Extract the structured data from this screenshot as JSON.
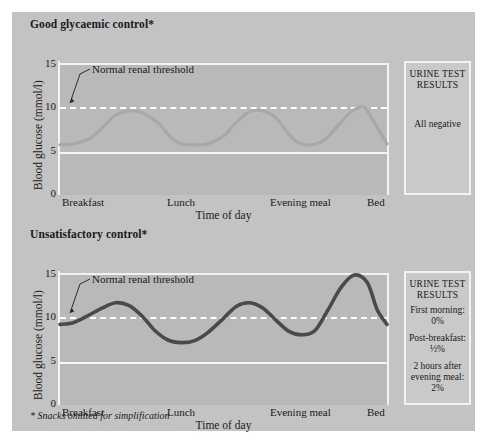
{
  "figure": {
    "background_color": "#c3c3c3",
    "plot_background_color": "#b9b9b9",
    "footnote": "* Snacks omitted for simplification"
  },
  "panels": [
    {
      "id": "good",
      "title": "Good glycaemic control*",
      "ylabel": "Blood glucose (mmol/l)",
      "xlabel": "Time of day",
      "yticks": [
        "15",
        "10",
        "5",
        "0"
      ],
      "xticks": [
        "Breakfast",
        "Lunch",
        "Evening meal",
        "Bed"
      ],
      "annotation": "Normal renal threshold",
      "urine_heading_line1": "URINE TEST",
      "urine_heading_line2": "RESULTS",
      "urine_results": [
        "All negative"
      ]
    },
    {
      "id": "bad",
      "title": "Unsatisfactory control*",
      "ylabel": "Blood glucose (mmol/l)",
      "xlabel": "Time of day",
      "yticks": [
        "15",
        "10",
        "5",
        "0"
      ],
      "xticks": [
        "Breakfast",
        "Lunch",
        "Evening meal",
        "Bed"
      ],
      "annotation": "Normal renal threshold",
      "urine_heading_line1": "URINE TEST",
      "urine_heading_line2": "RESULTS",
      "urine_results": [
        "First morning:",
        "0%",
        "Post-breakfast:",
        "½%",
        "2 hours after",
        "evening meal:",
        "2%"
      ]
    }
  ],
  "chart_data": [
    {
      "type": "line",
      "title": "Good glycaemic control*",
      "xlabel": "Time of day",
      "ylabel": "Blood glucose (mmol/l)",
      "ylim": [
        0,
        15
      ],
      "yticks": [
        0,
        5,
        10,
        15
      ],
      "x_categories": [
        "Breakfast",
        "Lunch",
        "Evening meal",
        "Bed"
      ],
      "x_category_positions": [
        0,
        0.37,
        0.73,
        1.0
      ],
      "grid": false,
      "legend": "none",
      "line_color": "#a8a8a8",
      "threshold_line": {
        "label": "Normal renal threshold",
        "value": 10.2,
        "style": "dashed",
        "color": "#ffffff"
      },
      "gridline_5": {
        "value": 5,
        "color": "#f6f6f6"
      },
      "series": [
        {
          "name": "Blood glucose",
          "x": [
            0.0,
            0.04,
            0.09,
            0.13,
            0.17,
            0.21,
            0.25,
            0.3,
            0.34,
            0.37,
            0.41,
            0.45,
            0.5,
            0.54,
            0.58,
            0.62,
            0.66,
            0.7,
            0.73,
            0.77,
            0.81,
            0.85,
            0.89,
            0.93,
            0.96,
            1.0
          ],
          "values": [
            5.8,
            5.9,
            6.5,
            7.8,
            9.2,
            9.7,
            9.5,
            8.3,
            6.6,
            5.9,
            5.8,
            5.9,
            6.8,
            8.4,
            9.6,
            9.7,
            8.9,
            7.0,
            6.0,
            5.8,
            6.4,
            8.0,
            9.6,
            10.1,
            8.4,
            5.9
          ]
        }
      ]
    },
    {
      "type": "line",
      "title": "Unsatisfactory control*",
      "xlabel": "Time of day",
      "ylabel": "Blood glucose (mmol/l)",
      "ylim": [
        0,
        15
      ],
      "yticks": [
        0,
        5,
        10,
        15
      ],
      "x_categories": [
        "Breakfast",
        "Lunch",
        "Evening meal",
        "Bed"
      ],
      "x_category_positions": [
        0,
        0.37,
        0.73,
        1.0
      ],
      "grid": false,
      "legend": "none",
      "line_color": "#4a4a4a",
      "threshold_line": {
        "label": "Normal renal threshold",
        "value": 10.2,
        "style": "dashed",
        "color": "#ffffff"
      },
      "gridline_5": {
        "value": 5,
        "color": "#f6f6f6"
      },
      "series": [
        {
          "name": "Blood glucose",
          "x": [
            0.0,
            0.04,
            0.08,
            0.13,
            0.17,
            0.21,
            0.25,
            0.29,
            0.33,
            0.37,
            0.41,
            0.45,
            0.5,
            0.54,
            0.58,
            0.62,
            0.66,
            0.7,
            0.74,
            0.78,
            0.82,
            0.86,
            0.9,
            0.94,
            0.97,
            1.0
          ],
          "values": [
            9.3,
            9.5,
            10.2,
            11.2,
            11.8,
            11.5,
            10.3,
            8.6,
            7.5,
            7.2,
            7.4,
            8.3,
            10.0,
            11.4,
            11.8,
            11.2,
            9.8,
            8.5,
            8.1,
            8.6,
            11.0,
            13.6,
            15.0,
            14.1,
            11.0,
            9.3
          ]
        }
      ]
    }
  ]
}
